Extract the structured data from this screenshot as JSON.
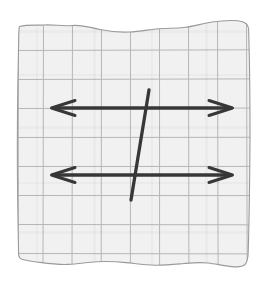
{
  "figure": {
    "title": "Parallel lines cut by a transversal on graph paper",
    "paper": {
      "name": "graph-paper",
      "fill_color": "#f1f1f1",
      "edge_color": "#9a9a9a",
      "grid_color": "#b6b6b6",
      "grid_spacing_px": 29,
      "torn_edges": [
        "top",
        "bottom",
        "left",
        "right"
      ],
      "bounds": {
        "x": 17,
        "y": 20,
        "width": 233,
        "height": 250
      }
    },
    "ink": {
      "color": "#373737",
      "stroke_width_px": 3.3
    },
    "elements": [
      {
        "name": "parallel-line-upper",
        "type": "double-headed-arrow",
        "x1": 52,
        "y1": 108,
        "x2": 232,
        "y2": 108,
        "arrowheads": [
          "left",
          "right"
        ]
      },
      {
        "name": "parallel-line-lower",
        "type": "double-headed-arrow",
        "x1": 52,
        "y1": 175,
        "x2": 232,
        "y2": 175,
        "arrowheads": [
          "left",
          "right"
        ]
      },
      {
        "name": "transversal-line",
        "type": "segment",
        "x1": 131,
        "y1": 200,
        "x2": 149,
        "y2": 90,
        "arrowheads": []
      }
    ]
  }
}
